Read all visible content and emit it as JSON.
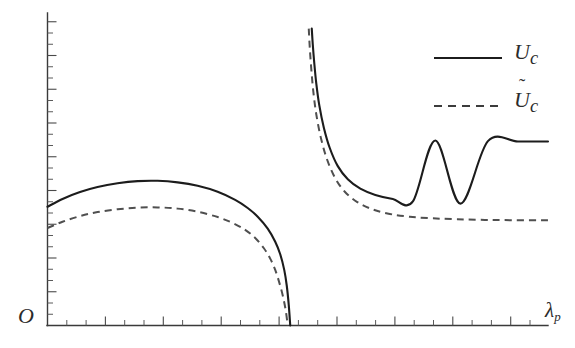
{
  "figure": {
    "background_color": "#ffffff",
    "width": 575,
    "height": 348
  },
  "axes": {
    "origin_label": "O",
    "x_axis_label": "λ",
    "x_axis_label_sub": "p",
    "y_axis_label": "",
    "x_axis_color": "#3a3a3a",
    "y_axis_color": "#3a3a3a",
    "grid": "off"
  },
  "legend": {
    "position": "top-right",
    "entries": [
      {
        "id": "uc",
        "symbol": "U",
        "subscript": "c",
        "accent": "",
        "label": "U_c",
        "style": "solid",
        "color": "#1c1c1c"
      },
      {
        "id": "uc-tilde",
        "symbol": "U",
        "subscript": "c",
        "accent": "˜",
        "label": "Ũ_c",
        "style": "dashed",
        "color": "#3c3c3c"
      }
    ]
  },
  "chart_data": {
    "type": "line",
    "title": "",
    "subtitle": "",
    "xlabel": "λ_p",
    "ylabel": "",
    "grid": false,
    "legend_position": "top-right",
    "axis_ticks_only": true,
    "tick_labels_shown": false,
    "xlim": [
      0,
      1
    ],
    "ylim": [
      0,
      1
    ],
    "annotations": [
      {
        "text": "O",
        "meaning": "origin marker at intersection of axes"
      },
      {
        "text": "vertical asymptote",
        "meaning": "both curves diverge near lambda_p critical value; left branch falls to zero, right branch rises to infinity"
      }
    ],
    "series": [
      {
        "name": "U_c",
        "style": "solid",
        "color": "#1c1c1c",
        "branches": [
          {
            "name": "left-branch",
            "x": [
              0.0,
              0.03,
              0.065,
              0.1,
              0.14,
              0.18,
              0.22,
              0.26,
              0.3,
              0.34,
              0.375,
              0.4,
              0.42,
              0.44,
              0.455,
              0.465,
              0.473,
              0.478,
              0.482,
              0.485
            ],
            "y": [
              0.38,
              0.405,
              0.427,
              0.443,
              0.455,
              0.462,
              0.463,
              0.458,
              0.447,
              0.428,
              0.402,
              0.376,
              0.348,
              0.31,
              0.268,
              0.228,
              0.178,
              0.128,
              0.066,
              0.0
            ]
          },
          {
            "name": "right-branch",
            "x": [
              0.528,
              0.53,
              0.533,
              0.537,
              0.543,
              0.552,
              0.564,
              0.58,
              0.6,
              0.625,
              0.655,
              0.69,
              0.73,
              0.775,
              0.825,
              0.88,
              0.94,
              1.0
            ],
            "y": [
              0.95,
              0.9,
              0.84,
              0.775,
              0.705,
              0.634,
              0.568,
              0.51,
              0.468,
              0.438,
              0.418,
              0.405,
              0.397,
              0.592,
              0.39,
              0.59,
              0.589,
              0.589
            ]
          }
        ]
      },
      {
        "name": "U_c_tilde",
        "style": "dashed",
        "color": "#3c3c3c",
        "branches": [
          {
            "name": "left-branch",
            "x": [
              0.0,
              0.03,
              0.065,
              0.1,
              0.14,
              0.18,
              0.22,
              0.26,
              0.3,
              0.34,
              0.37,
              0.395,
              0.415,
              0.432,
              0.445,
              0.455,
              0.463,
              0.47,
              0.476,
              0.48
            ],
            "y": [
              0.312,
              0.332,
              0.35,
              0.363,
              0.372,
              0.377,
              0.378,
              0.374,
              0.364,
              0.347,
              0.328,
              0.306,
              0.28,
              0.248,
              0.214,
              0.178,
              0.138,
              0.096,
              0.048,
              0.0
            ]
          },
          {
            "name": "right-branch",
            "x": [
              0.522,
              0.524,
              0.527,
              0.531,
              0.537,
              0.546,
              0.558,
              0.574,
              0.594,
              0.619,
              0.649,
              0.684,
              0.724,
              0.769,
              0.819,
              0.874,
              0.934,
              1.0
            ],
            "y": [
              0.95,
              0.89,
              0.822,
              0.75,
              0.676,
              0.602,
              0.534,
              0.474,
              0.428,
              0.395,
              0.372,
              0.357,
              0.348,
              0.343,
              0.34,
              0.338,
              0.337,
              0.337
            ]
          }
        ]
      }
    ]
  }
}
